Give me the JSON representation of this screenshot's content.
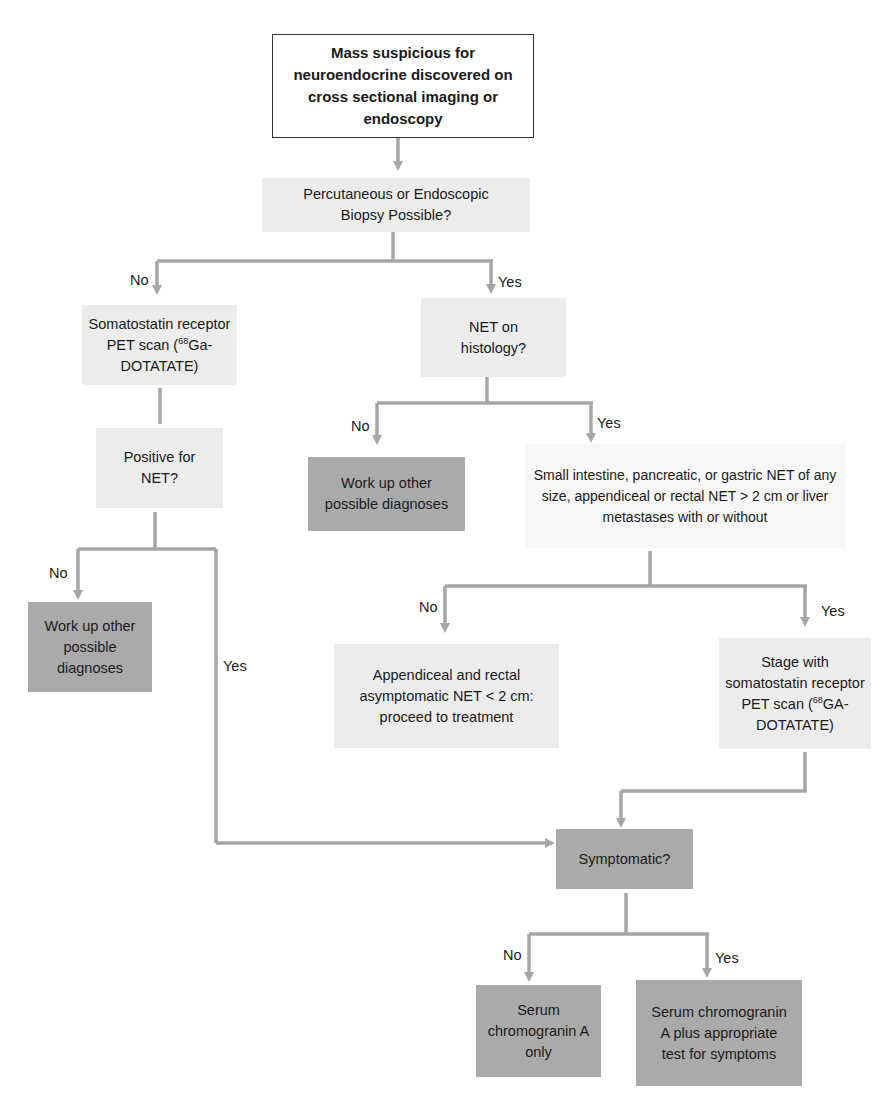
{
  "diagram": {
    "type": "flowchart",
    "connector_color": "#a6a6a6",
    "nodes": {
      "start": {
        "text": "Mass suspicious for neuroendocrine discovered on cross sectional imaging or endoscopy"
      },
      "biopsy": {
        "text": "Percutaneous or Endoscopic Biopsy Possible?"
      },
      "somatostatin_pet": {
        "prefix": "Somatostatin receptor PET scan (",
        "sup": "68",
        "suffix": "Ga-DOTATATE)"
      },
      "net_histology": {
        "text": "NET on histology?"
      },
      "positive_net": {
        "text": "Positive for NET?"
      },
      "workup_right": {
        "text": "Work up other possible diagnoses"
      },
      "small_intestine": {
        "text": "Small intestine, pancreatic, or gastric NET of any size, appendiceal or rectal NET > 2 cm or liver metastases with or without"
      },
      "workup_left": {
        "text": "Work up other possible diagnoses"
      },
      "appendiceal": {
        "text": "Appendiceal and rectal asymptomatic NET < 2 cm: proceed to treatment"
      },
      "stage_pet": {
        "prefix": "Stage with somatostatin receptor PET scan (",
        "sup": "68",
        "suffix": "GA-DOTATATE)"
      },
      "symptomatic": {
        "text": "Symptomatic?"
      },
      "serum_only": {
        "text": "Serum chromogranin A only"
      },
      "serum_plus": {
        "text": "Serum chromogranin A plus appropriate test for symptoms"
      }
    },
    "edge_labels": {
      "biopsy_no": "No",
      "biopsy_yes": "Yes",
      "histology_no": "No",
      "histology_yes": "Yes",
      "positive_no": "No",
      "positive_yes": "Yes",
      "small_no": "No",
      "small_yes": "Yes",
      "symptomatic_no": "No",
      "symptomatic_yes": "Yes"
    }
  }
}
